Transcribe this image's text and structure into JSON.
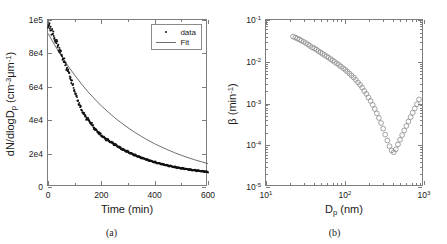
{
  "figure": {
    "panels": [
      {
        "id": "a",
        "caption": "(a)",
        "legend": [
          {
            "label": "data",
            "symbol": "dot-marker"
          },
          {
            "label": "Fit",
            "symbol": "line-marker"
          }
        ]
      },
      {
        "id": "b",
        "caption": "(b)"
      }
    ]
  },
  "chart_data": [
    {
      "type": "scatter",
      "panel": "a",
      "title": "",
      "xlabel": "Time (min)",
      "ylabel": "dN/dlogD_p (cm^-3 um^-1)",
      "ylabel_parts": {
        "main": "dN/dlogD",
        "sub": "p",
        "unit_open": " (cm",
        "unit_sup1": "-3",
        "unit_mu": "μm",
        "unit_sup2": "-1",
        "unit_close": ")"
      },
      "xscale": "linear",
      "yscale": "linear",
      "xlim": [
        0,
        600
      ],
      "ylim": [
        0,
        100000
      ],
      "xticks": [
        0,
        200,
        400,
        600
      ],
      "xticklabels": [
        "0",
        "200",
        "400",
        "600"
      ],
      "yticks": [
        0,
        20000,
        40000,
        60000,
        80000,
        100000
      ],
      "yticklabels": [
        "0",
        "2e4",
        "4e4",
        "6e4",
        "8e4",
        "1e5"
      ],
      "grid": false,
      "legend_position": "upper right",
      "series": [
        {
          "name": "data",
          "style": "dots",
          "color": "#111111",
          "x": [
            0,
            5,
            10,
            15,
            20,
            25,
            30,
            35,
            40,
            45,
            50,
            55,
            60,
            65,
            70,
            75,
            80,
            85,
            90,
            95,
            100,
            105,
            110,
            115,
            120,
            125,
            130,
            135,
            140,
            145,
            150,
            155,
            160,
            165,
            170,
            175,
            180,
            190,
            200,
            210,
            220,
            230,
            240,
            250,
            260,
            270,
            280,
            290,
            300,
            310,
            320,
            330,
            340,
            350,
            360,
            370,
            380,
            390,
            400,
            410,
            420,
            430,
            440,
            450,
            460,
            470,
            480,
            490,
            500,
            510,
            520,
            530,
            540,
            550,
            560,
            570,
            580,
            590,
            600
          ],
          "y": [
            95500,
            96200,
            95000,
            93000,
            91000,
            89000,
            87000,
            85500,
            83500,
            81500,
            79500,
            77500,
            75500,
            73500,
            71500,
            69500,
            67500,
            65000,
            62500,
            60000,
            57500,
            55000,
            52500,
            50500,
            48500,
            46500,
            45000,
            43500,
            42500,
            41000,
            40500,
            39500,
            38500,
            37500,
            36000,
            35000,
            34000,
            32500,
            31000,
            29500,
            28500,
            27500,
            26500,
            25500,
            24500,
            23500,
            22500,
            21800,
            21000,
            20200,
            19500,
            18800,
            18200,
            17500,
            17000,
            16400,
            15900,
            15400,
            14900,
            14400,
            14000,
            13600,
            13200,
            12800,
            12500,
            12100,
            11800,
            11500,
            11200,
            11000,
            10700,
            10500,
            10200,
            10000,
            9800,
            9600,
            9400,
            9200,
            9000
          ]
        },
        {
          "name": "Fit",
          "style": "line",
          "color": "#6e6e6e",
          "x": [
            0,
            25,
            50,
            75,
            100,
            125,
            150,
            175,
            200,
            225,
            250,
            275,
            300,
            325,
            350,
            375,
            400,
            425,
            450,
            475,
            500,
            525,
            550,
            575,
            600
          ],
          "y": [
            92000,
            85000,
            78500,
            72500,
            67000,
            61800,
            57000,
            52700,
            48600,
            45000,
            41500,
            38400,
            35500,
            32800,
            30300,
            28000,
            25900,
            24000,
            22200,
            20500,
            19000,
            17600,
            16300,
            15100,
            14000
          ]
        }
      ]
    },
    {
      "type": "scatter",
      "panel": "b",
      "title": "",
      "xlabel": "D_p (nm)",
      "ylabel": "beta (min^-1)",
      "xlabel_parts": {
        "main": "D",
        "sub": "p",
        "unit": " (nm)"
      },
      "ylabel_parts": {
        "main": "β (min",
        "sup": "-1",
        "close": ")"
      },
      "xscale": "log",
      "yscale": "log",
      "xlim": [
        10,
        1000
      ],
      "ylim": [
        1e-05,
        0.1
      ],
      "xticks": [
        10,
        100,
        1000
      ],
      "xticklabels": [
        "10^1",
        "10^2",
        "10^3"
      ],
      "yticks": [
        1e-05,
        0.0001,
        0.001,
        0.01,
        0.1
      ],
      "yticklabels": [
        "10^-5",
        "10^-4",
        "10^-3",
        "10^-2",
        "10^-1"
      ],
      "grid": false,
      "marker": "open-circle",
      "marker_color": "#8c8c8c",
      "series": [
        {
          "name": "beta",
          "x": [
            22,
            23.5,
            25,
            26.5,
            28,
            30,
            32,
            34,
            36,
            38.5,
            41,
            43.5,
            46,
            49,
            52,
            55,
            58.5,
            62,
            66,
            70,
            74,
            79,
            84,
            89,
            95,
            101,
            107,
            114,
            121,
            129,
            137,
            146,
            155,
            165,
            175,
            186,
            198,
            211,
            224,
            238,
            253,
            269,
            286,
            304,
            323,
            344,
            366,
            389,
            414,
            440,
            468,
            497,
            529,
            562,
            598,
            636,
            676,
            719,
            765,
            813,
            865
          ],
          "y": [
            0.04,
            0.038,
            0.036,
            0.034,
            0.032,
            0.03,
            0.028,
            0.026,
            0.024,
            0.022,
            0.021,
            0.0195,
            0.018,
            0.0168,
            0.0155,
            0.0145,
            0.0135,
            0.0125,
            0.0116,
            0.0107,
            0.0099,
            0.0091,
            0.0084,
            0.0077,
            0.007,
            0.0064,
            0.0058,
            0.0052,
            0.0047,
            0.0042,
            0.0037,
            0.0032,
            0.0028,
            0.0024,
            0.002,
            0.0017,
            0.0014,
            0.00115,
            0.00093,
            0.00074,
            0.00058,
            0.00045,
            0.00034,
            0.00025,
            0.00018,
            0.00013,
            9.5e-05,
            7.5e-05,
            6.8e-05,
            8e-05,
            0.000105,
            0.000135,
            0.000175,
            0.000225,
            0.00029,
            0.00037,
            0.00047,
            0.0006,
            0.00076,
            0.00096,
            0.00125
          ]
        }
      ]
    }
  ]
}
